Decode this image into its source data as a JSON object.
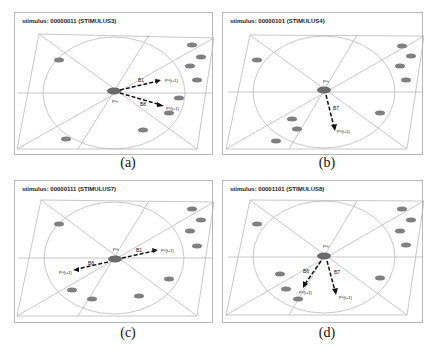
{
  "figure": {
    "panels": [
      {
        "id": "a",
        "title": "stimulus: 00000011 (STIMULUS3)",
        "caption": "(a)",
        "center_label": "P^t",
        "arrows": [
          {
            "label": "B1",
            "target_label": "P^{t+1}",
            "dx": 45,
            "dy": -10
          },
          {
            "label": "B8",
            "target_label": "P^{t+1}",
            "dx": 48,
            "dy": 14
          }
        ]
      },
      {
        "id": "b",
        "title": "stimulus: 00000101 (STIMULUS4)",
        "caption": "(b)",
        "center_label": "P^t",
        "arrows": [
          {
            "label": "B7",
            "target_label": "P^{t+1}",
            "dx": 10,
            "dy": 38
          }
        ]
      },
      {
        "id": "c",
        "title": "stimulus: 00000111 (STIMULUS7)",
        "caption": "(c)",
        "center_label": "P^t",
        "arrows": [
          {
            "label": "B1",
            "target_label": "P^{t+1}",
            "dx": 42,
            "dy": -8
          },
          {
            "label": "B8",
            "target_label": "P^{t+1}",
            "dx": -43,
            "dy": 11
          }
        ]
      },
      {
        "id": "d",
        "title": "stimulus: 00001101 (STIMULUS8)",
        "caption": "(d)",
        "center_label": "P^t",
        "arrows": [
          {
            "label": "B6",
            "target_label": "P^{t+1}",
            "dx": -20,
            "dy": 31
          },
          {
            "label": "B7",
            "target_label": "P^{t+1}",
            "dx": 11,
            "dy": 37
          }
        ]
      }
    ],
    "arrow_color": "#111111",
    "line_color": "#b0b0b0",
    "robot_color": "#7a7a7a"
  }
}
